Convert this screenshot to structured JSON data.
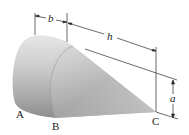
{
  "figure": {
    "type": "cone-with-rounded-base",
    "points": {
      "A": "A",
      "B": "B",
      "C": "C"
    },
    "dimensions": {
      "b": "b",
      "h": "h",
      "a": "a"
    },
    "colors": {
      "body_light": "#e4e4e4",
      "body_mid": "#b8b8b8",
      "body_dark": "#8e8e8e",
      "line": "#2a2a2a"
    }
  }
}
